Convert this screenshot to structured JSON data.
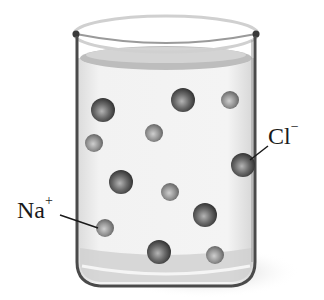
{
  "figure": {
    "labels": {
      "chloride": {
        "base": "Cl",
        "charge": "−"
      },
      "sodium": {
        "base": "Na",
        "charge": "+"
      }
    },
    "colors": {
      "background": "#ffffff",
      "beaker_outline": "#4a4a4a",
      "liquid": "#ececec",
      "chloride_ion": "#555555",
      "sodium_ion": "#8a8a8a"
    },
    "ions": {
      "chloride": [
        {
          "cx": 103,
          "cy": 110,
          "r": 12
        },
        {
          "cx": 183,
          "cy": 100,
          "r": 12
        },
        {
          "cx": 243,
          "cy": 165,
          "r": 12
        },
        {
          "cx": 121,
          "cy": 182,
          "r": 12
        },
        {
          "cx": 205,
          "cy": 215,
          "r": 12
        },
        {
          "cx": 159,
          "cy": 252,
          "r": 12
        }
      ],
      "sodium": [
        {
          "cx": 230,
          "cy": 100,
          "r": 9
        },
        {
          "cx": 94,
          "cy": 143,
          "r": 9
        },
        {
          "cx": 154,
          "cy": 133,
          "r": 9
        },
        {
          "cx": 170,
          "cy": 192,
          "r": 9
        },
        {
          "cx": 105,
          "cy": 228,
          "r": 9
        },
        {
          "cx": 215,
          "cy": 255,
          "r": 9
        }
      ]
    }
  }
}
